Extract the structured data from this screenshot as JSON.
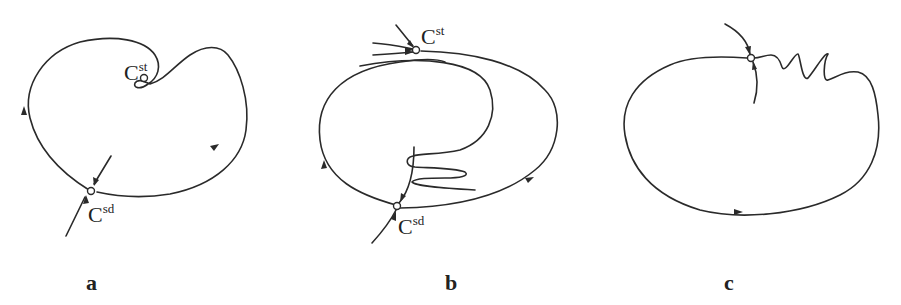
{
  "figure": {
    "panels": [
      {
        "id": "a",
        "label": "a",
        "points": [
          {
            "name": "C",
            "superscript": "st",
            "role": "stable point inside inward fold"
          },
          {
            "name": "C",
            "superscript": "sd",
            "role": "saddle point on closed orbit"
          }
        ]
      },
      {
        "id": "b",
        "label": "b",
        "points": [
          {
            "name": "C",
            "superscript": "st",
            "role": "stable point on outer orbit"
          },
          {
            "name": "C",
            "superscript": "sd",
            "role": "saddle point with folded inner separatrix"
          }
        ]
      },
      {
        "id": "c",
        "label": "c",
        "points": [
          {
            "name": "",
            "superscript": "",
            "role": "unlabeled point with zigzag orbit"
          }
        ]
      }
    ]
  }
}
